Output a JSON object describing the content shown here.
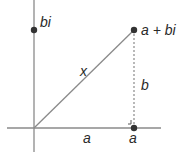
{
  "diagram": {
    "title": "",
    "labels": {
      "imag_point": "bi",
      "complex_point": "a + bi",
      "hypotenuse": "x",
      "vertical_leg": "b",
      "horizontal_leg": "a",
      "real_point": "a"
    },
    "colors": {
      "axis": "#8a8a8a",
      "line": "#8a8a8a",
      "point": "#333333",
      "text": "#2a2a2a"
    }
  }
}
